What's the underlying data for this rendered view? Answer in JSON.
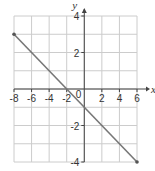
{
  "chart_data": {
    "type": "line",
    "title": "",
    "xlabel": "x",
    "ylabel": "y",
    "xlim": [
      -8,
      6
    ],
    "ylim": [
      -4,
      4
    ],
    "grid": true,
    "x_ticks": [
      -8,
      -6,
      -4,
      -2,
      2,
      4,
      6
    ],
    "y_ticks": [
      4,
      2,
      -2,
      -4
    ],
    "origin_label": "0",
    "series": [
      {
        "name": "line",
        "points": [
          [
            -8,
            3
          ],
          [
            6,
            -4
          ]
        ],
        "color": "#777777"
      }
    ],
    "x_tick_labels": [
      "-8",
      "-6",
      "-4",
      "-2",
      "2",
      "4",
      "6"
    ],
    "y_tick_labels": [
      "4",
      "2",
      "-2",
      "-4"
    ]
  },
  "colors": {
    "grid": "#cccccc",
    "axis": "#444444",
    "line": "#777777"
  }
}
